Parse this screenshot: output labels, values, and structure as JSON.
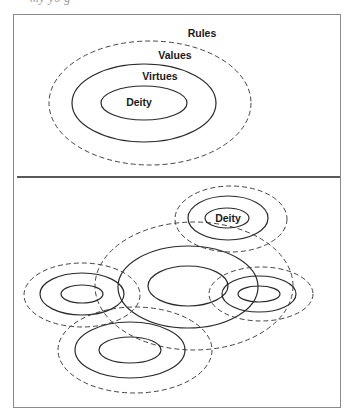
{
  "caption_fragment": "my yo     g",
  "top_panel": {
    "labels": {
      "rules": "Rules",
      "values": "Values",
      "virtues": "Virtues",
      "deity": "Deity"
    }
  },
  "bottom_panel": {
    "labels": {
      "deity": "Deity"
    },
    "clusters": [
      {
        "name": "top-right",
        "cx": 231,
        "cy": 219,
        "outer": [
          56,
          33
        ],
        "middle": [
          40,
          22
        ],
        "inner": [
          22,
          10
        ],
        "labeled": true
      },
      {
        "name": "center",
        "cx": 194,
        "cy": 286,
        "outer": [
          99,
          64
        ],
        "middle": [
          70,
          41
        ],
        "inner": [
          40,
          20
        ],
        "labeled": false
      },
      {
        "name": "left",
        "cx": 82,
        "cy": 294,
        "outer": [
          58,
          32
        ],
        "middle": [
          42,
          21
        ],
        "inner": [
          21,
          9
        ],
        "labeled": false
      },
      {
        "name": "right",
        "cx": 260,
        "cy": 294,
        "outer": [
          52,
          27
        ],
        "middle": [
          37,
          18
        ],
        "inner": [
          21,
          8
        ],
        "labeled": false
      },
      {
        "name": "bottom",
        "cx": 133,
        "cy": 350,
        "outer": [
          77,
          43
        ],
        "middle": [
          55,
          28
        ],
        "inner": [
          31,
          13
        ],
        "labeled": false
      }
    ]
  },
  "colors": {
    "stroke": "#2a2a2a",
    "frame": "#8a8a8a",
    "background": "#ffffff"
  }
}
